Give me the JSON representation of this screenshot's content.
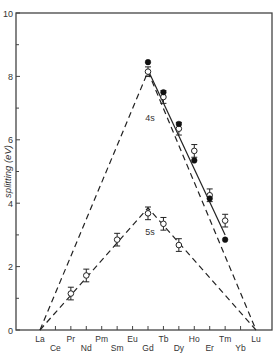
{
  "chart_data": {
    "type": "line",
    "title": "",
    "xlabel": "",
    "ylabel": "splitting (eV)",
    "ylim": [
      0,
      10
    ],
    "yticks_major": [
      0,
      2,
      4,
      6,
      8,
      10
    ],
    "yticks_minor": [
      1,
      3,
      5,
      7,
      9
    ],
    "grid": false,
    "legend": null,
    "categories": [
      "La",
      "Ce",
      "Pr",
      "Nd",
      "Pm",
      "Sm",
      "Eu",
      "Gd",
      "Tb",
      "Dy",
      "Ho",
      "Er",
      "Tm",
      "Yb",
      "Lu"
    ],
    "label_rows": {
      "upper": [
        "La",
        "Pr",
        "Pm",
        "Eu",
        "Tb",
        "Ho",
        "Tm",
        "Lu"
      ],
      "lower": [
        "Ce",
        "Nd",
        "Sm",
        "Gd",
        "Dy",
        "Er",
        "Yb"
      ]
    },
    "annotations": [
      {
        "text": "4s",
        "x": "Gd",
        "y": 6.6
      },
      {
        "text": "5s",
        "x": "Gd",
        "y": 3.0
      }
    ],
    "series": [
      {
        "name": "4s theory (dashed)",
        "style": "dashed",
        "points": [
          {
            "x": "La",
            "y": 0
          },
          {
            "x": "Gd",
            "y": 8.15
          },
          {
            "x": "Lu",
            "y": 0
          }
        ]
      },
      {
        "name": "5s theory (dashed)",
        "style": "dashed",
        "points": [
          {
            "x": "La",
            "y": 0
          },
          {
            "x": "Gd",
            "y": 3.85
          },
          {
            "x": "Lu",
            "y": 0
          }
        ]
      },
      {
        "name": "4s fit (solid)",
        "style": "solid",
        "points": [
          {
            "x": "Gd",
            "y": 8.2
          },
          {
            "x": "Tm",
            "y": 3.0
          }
        ]
      },
      {
        "name": "4s experimental (open, with error bars)",
        "marker": "open-circle",
        "points": [
          {
            "x": "Gd",
            "y": 8.15,
            "err": 0.15
          },
          {
            "x": "Tb",
            "y": 7.35,
            "err": 0.2
          },
          {
            "x": "Dy",
            "y": 6.35,
            "err": 0.2
          },
          {
            "x": "Ho",
            "y": 5.65,
            "err": 0.2
          },
          {
            "x": "Er",
            "y": 4.25,
            "err": 0.2
          },
          {
            "x": "Tm",
            "y": 3.45,
            "err": 0.2
          }
        ]
      },
      {
        "name": "4s calculated (filled)",
        "marker": "filled-circle",
        "points": [
          {
            "x": "Gd",
            "y": 8.45
          },
          {
            "x": "Tb",
            "y": 7.5
          },
          {
            "x": "Dy",
            "y": 6.5
          },
          {
            "x": "Ho",
            "y": 5.35
          },
          {
            "x": "Er",
            "y": 4.15
          },
          {
            "x": "Tm",
            "y": 2.85
          }
        ]
      },
      {
        "name": "5s experimental (open, with error bars)",
        "marker": "open-circle",
        "points": [
          {
            "x": "Pr",
            "y": 1.15,
            "err": 0.2
          },
          {
            "x": "Nd",
            "y": 1.72,
            "err": 0.2
          },
          {
            "x": "Sm",
            "y": 2.85,
            "err": 0.2
          },
          {
            "x": "Gd",
            "y": 3.68,
            "err": 0.2
          },
          {
            "x": "Tb",
            "y": 3.35,
            "err": 0.2
          },
          {
            "x": "Dy",
            "y": 2.68,
            "err": 0.2
          }
        ]
      }
    ],
    "layout": {
      "plot_left": 16,
      "plot_right": 272,
      "plot_top": 13,
      "plot_bottom": 330,
      "x_first": 40,
      "x_last": 256
    }
  },
  "labels": {
    "ylabel": "splitting (eV)"
  }
}
